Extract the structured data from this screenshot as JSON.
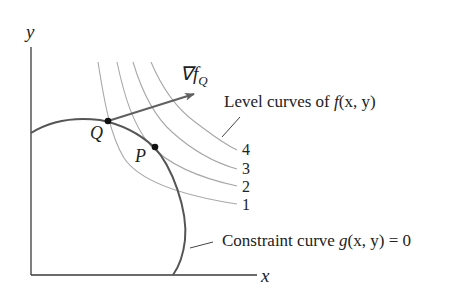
{
  "diagram": {
    "axes": {
      "x_label": "x",
      "y_label": "y"
    },
    "points": [
      {
        "name": "Q",
        "label": "Q"
      },
      {
        "name": "P",
        "label": "P"
      }
    ],
    "gradient": {
      "symbol": "∇f",
      "subscript": "Q"
    },
    "level_curves": {
      "label_prefix": "Level curves of ",
      "label_func": "f",
      "label_args": "(x, y)",
      "values": [
        "4",
        "3",
        "2",
        "1"
      ]
    },
    "constraint": {
      "label_prefix": "Constraint curve ",
      "label_func": "g",
      "label_args": "(x, y) = 0"
    },
    "colors": {
      "axis": "#3a3a3a",
      "constraint_curve": "#555555",
      "level_curve": "#a8a8a8",
      "gradient_arrow": "#606060",
      "point": "#111111"
    }
  }
}
